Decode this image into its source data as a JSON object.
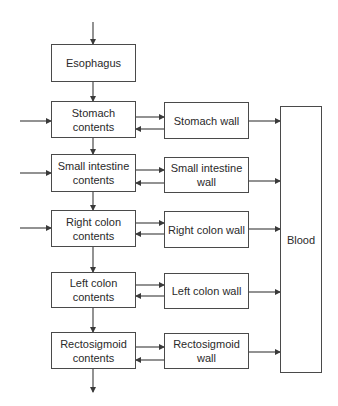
{
  "diagram": {
    "type": "compartment-flow",
    "colors": {
      "line": "#3a3a3a",
      "box_border": "#4a4a4a",
      "text": "#2a2a2a",
      "background": "#ffffff"
    },
    "nodes": {
      "esophagus": "Esophagus",
      "stomach_contents": "Stomach contents",
      "stomach_wall": "Stomach wall",
      "small_intestine_contents": "Small intestine contents",
      "small_intestine_wall": "Small intestine wall",
      "right_colon_contents": "Right colon contents",
      "right_colon_wall": "Right colon wall",
      "left_colon_contents": "Left colon contents",
      "left_colon_wall": "Left colon wall",
      "rectosigmoid_contents": "Rectosigmoid contents",
      "rectosigmoid_wall": "Rectosigmoid wall",
      "blood": "Blood"
    },
    "edges": [
      {
        "from": "input",
        "to": "esophagus"
      },
      {
        "from": "esophagus",
        "to": "stomach_contents"
      },
      {
        "from": "external_input",
        "to": "stomach_contents"
      },
      {
        "from": "stomach_contents",
        "to": "stomach_wall"
      },
      {
        "from": "stomach_wall",
        "to": "stomach_contents"
      },
      {
        "from": "stomach_wall",
        "to": "blood"
      },
      {
        "from": "stomach_contents",
        "to": "small_intestine_contents"
      },
      {
        "from": "external_input",
        "to": "small_intestine_contents"
      },
      {
        "from": "small_intestine_contents",
        "to": "small_intestine_wall"
      },
      {
        "from": "small_intestine_wall",
        "to": "small_intestine_contents"
      },
      {
        "from": "small_intestine_wall",
        "to": "blood"
      },
      {
        "from": "small_intestine_contents",
        "to": "right_colon_contents"
      },
      {
        "from": "external_input",
        "to": "right_colon_contents"
      },
      {
        "from": "right_colon_contents",
        "to": "right_colon_wall"
      },
      {
        "from": "right_colon_wall",
        "to": "right_colon_contents"
      },
      {
        "from": "right_colon_wall",
        "to": "blood"
      },
      {
        "from": "right_colon_contents",
        "to": "left_colon_contents"
      },
      {
        "from": "left_colon_contents",
        "to": "left_colon_wall"
      },
      {
        "from": "left_colon_wall",
        "to": "left_colon_contents"
      },
      {
        "from": "left_colon_wall",
        "to": "blood"
      },
      {
        "from": "left_colon_contents",
        "to": "rectosigmoid_contents"
      },
      {
        "from": "rectosigmoid_contents",
        "to": "rectosigmoid_wall"
      },
      {
        "from": "rectosigmoid_wall",
        "to": "rectosigmoid_contents"
      },
      {
        "from": "rectosigmoid_wall",
        "to": "blood"
      },
      {
        "from": "rectosigmoid_contents",
        "to": "output"
      }
    ]
  }
}
